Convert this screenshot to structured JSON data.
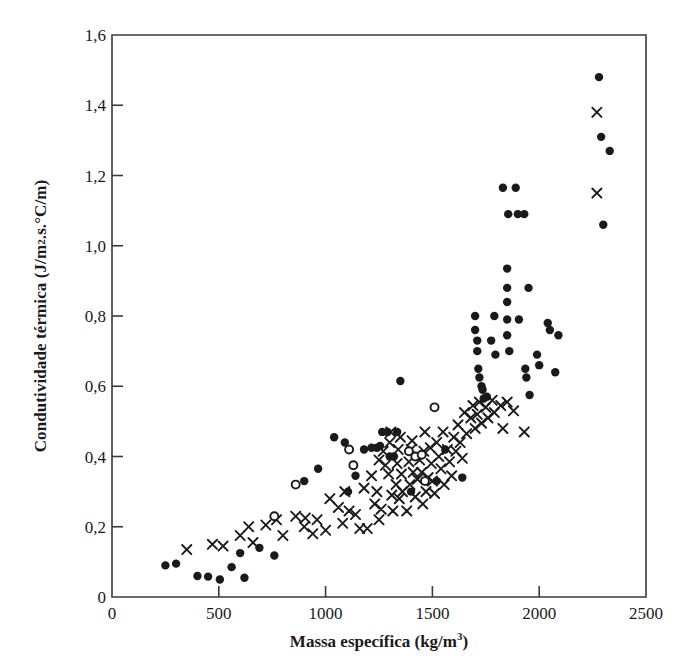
{
  "chart_data": {
    "type": "scatter",
    "title": "",
    "xlabel": "Massa específica (kg/m³)",
    "xlabel_main": "Massa específica (kg/m",
    "xlabel_sup": "3",
    "xlabel_tail": ")",
    "ylabel": "Condutividade térmica (J/m².s.°C/m)",
    "ylabel_main": "Condutividade térmica (J/m",
    "ylabel_sup": "2",
    "ylabel_tail": ".s.°C/m)",
    "xlim": [
      0,
      2500
    ],
    "ylim": [
      0,
      1.6
    ],
    "xticks": [
      0,
      500,
      1000,
      1500,
      2000,
      2500
    ],
    "xtick_labels": [
      "0",
      "500",
      "1000",
      "1500",
      "2000",
      "2500"
    ],
    "yticks": [
      0,
      0.2,
      0.4,
      0.6,
      0.8,
      1.0,
      1.2,
      1.4,
      1.6
    ],
    "ytick_labels": [
      "0",
      "0,2",
      "0,4",
      "0,6",
      "0,8",
      "1,0",
      "1,2",
      "1,4",
      "1,6"
    ],
    "grid": false,
    "legend": "none",
    "marker_color": "#1a1a1a",
    "frame_color": "#3a3a3a",
    "series": [
      {
        "name": "filled-circle",
        "marker": "filled-circle",
        "points": [
          [
            250,
            0.09
          ],
          [
            300,
            0.095
          ],
          [
            400,
            0.06
          ],
          [
            450,
            0.058
          ],
          [
            505,
            0.05
          ],
          [
            560,
            0.085
          ],
          [
            600,
            0.125
          ],
          [
            620,
            0.055
          ],
          [
            690,
            0.14
          ],
          [
            760,
            0.118
          ],
          [
            900,
            0.33
          ],
          [
            965,
            0.365
          ],
          [
            1040,
            0.455
          ],
          [
            1090,
            0.44
          ],
          [
            1105,
            0.3
          ],
          [
            1140,
            0.345
          ],
          [
            1180,
            0.42
          ],
          [
            1215,
            0.425
          ],
          [
            1240,
            0.425
          ],
          [
            1255,
            0.43
          ],
          [
            1265,
            0.47
          ],
          [
            1290,
            0.47
          ],
          [
            1300,
            0.4
          ],
          [
            1320,
            0.4
          ],
          [
            1335,
            0.47
          ],
          [
            1350,
            0.615
          ],
          [
            1400,
            0.3
          ],
          [
            1520,
            0.33
          ],
          [
            1560,
            0.42
          ],
          [
            1640,
            0.34
          ],
          [
            1700,
            0.76
          ],
          [
            1700,
            0.8
          ],
          [
            1710,
            0.7
          ],
          [
            1710,
            0.73
          ],
          [
            1715,
            0.65
          ],
          [
            1720,
            0.625
          ],
          [
            1730,
            0.6
          ],
          [
            1735,
            0.59
          ],
          [
            1740,
            0.565
          ],
          [
            1755,
            0.57
          ],
          [
            1775,
            0.73
          ],
          [
            1790,
            0.8
          ],
          [
            1795,
            0.69
          ],
          [
            1830,
            1.165
          ],
          [
            1850,
            0.935
          ],
          [
            1850,
            0.88
          ],
          [
            1850,
            0.84
          ],
          [
            1850,
            0.79
          ],
          [
            1850,
            0.745
          ],
          [
            1855,
            1.09
          ],
          [
            1860,
            0.7
          ],
          [
            1890,
            1.165
          ],
          [
            1900,
            1.09
          ],
          [
            1905,
            0.79
          ],
          [
            1930,
            1.09
          ],
          [
            1935,
            0.65
          ],
          [
            1940,
            0.625
          ],
          [
            1950,
            0.88
          ],
          [
            1955,
            0.575
          ],
          [
            1990,
            0.69
          ],
          [
            2000,
            0.66
          ],
          [
            2040,
            0.78
          ],
          [
            2050,
            0.76
          ],
          [
            2075,
            0.64
          ],
          [
            2090,
            0.745
          ],
          [
            2280,
            1.48
          ],
          [
            2290,
            1.31
          ],
          [
            2330,
            1.27
          ],
          [
            2300,
            1.06
          ]
        ]
      },
      {
        "name": "x-cross",
        "marker": "x-cross",
        "points": [
          [
            350,
            0.135
          ],
          [
            470,
            0.15
          ],
          [
            520,
            0.145
          ],
          [
            600,
            0.175
          ],
          [
            640,
            0.2
          ],
          [
            660,
            0.155
          ],
          [
            720,
            0.205
          ],
          [
            770,
            0.22
          ],
          [
            800,
            0.175
          ],
          [
            860,
            0.23
          ],
          [
            900,
            0.2
          ],
          [
            905,
            0.225
          ],
          [
            940,
            0.18
          ],
          [
            960,
            0.22
          ],
          [
            1000,
            0.19
          ],
          [
            1020,
            0.28
          ],
          [
            1060,
            0.255
          ],
          [
            1080,
            0.21
          ],
          [
            1090,
            0.3
          ],
          [
            1110,
            0.245
          ],
          [
            1140,
            0.235
          ],
          [
            1160,
            0.195
          ],
          [
            1180,
            0.31
          ],
          [
            1195,
            0.195
          ],
          [
            1215,
            0.345
          ],
          [
            1230,
            0.265
          ],
          [
            1240,
            0.3
          ],
          [
            1250,
            0.39
          ],
          [
            1250,
            0.22
          ],
          [
            1260,
            0.25
          ],
          [
            1270,
            0.415
          ],
          [
            1280,
            0.375
          ],
          [
            1295,
            0.35
          ],
          [
            1300,
            0.44
          ],
          [
            1305,
            0.47
          ],
          [
            1310,
            0.29
          ],
          [
            1315,
            0.245
          ],
          [
            1330,
            0.32
          ],
          [
            1335,
            0.38
          ],
          [
            1340,
            0.42
          ],
          [
            1345,
            0.28
          ],
          [
            1350,
            0.455
          ],
          [
            1355,
            0.35
          ],
          [
            1360,
            0.3
          ],
          [
            1380,
            0.245
          ],
          [
            1390,
            0.385
          ],
          [
            1395,
            0.32
          ],
          [
            1400,
            0.42
          ],
          [
            1405,
            0.445
          ],
          [
            1410,
            0.355
          ],
          [
            1420,
            0.285
          ],
          [
            1430,
            0.335
          ],
          [
            1440,
            0.39
          ],
          [
            1450,
            0.355
          ],
          [
            1455,
            0.265
          ],
          [
            1460,
            0.415
          ],
          [
            1465,
            0.47
          ],
          [
            1470,
            0.3
          ],
          [
            1480,
            0.34
          ],
          [
            1490,
            0.425
          ],
          [
            1495,
            0.38
          ],
          [
            1500,
            0.33
          ],
          [
            1510,
            0.295
          ],
          [
            1520,
            0.44
          ],
          [
            1530,
            0.4
          ],
          [
            1540,
            0.365
          ],
          [
            1550,
            0.47
          ],
          [
            1555,
            0.32
          ],
          [
            1570,
            0.42
          ],
          [
            1580,
            0.385
          ],
          [
            1590,
            0.345
          ],
          [
            1600,
            0.455
          ],
          [
            1610,
            0.415
          ],
          [
            1620,
            0.49
          ],
          [
            1630,
            0.44
          ],
          [
            1640,
            0.395
          ],
          [
            1650,
            0.525
          ],
          [
            1660,
            0.465
          ],
          [
            1680,
            0.51
          ],
          [
            1690,
            0.545
          ],
          [
            1700,
            0.48
          ],
          [
            1710,
            0.52
          ],
          [
            1720,
            0.555
          ],
          [
            1730,
            0.495
          ],
          [
            1750,
            0.54
          ],
          [
            1760,
            0.51
          ],
          [
            1780,
            0.56
          ],
          [
            1790,
            0.525
          ],
          [
            1820,
            0.545
          ],
          [
            1830,
            0.48
          ],
          [
            1850,
            0.555
          ],
          [
            1880,
            0.53
          ],
          [
            1930,
            0.47
          ],
          [
            2270,
            1.38
          ],
          [
            2270,
            1.15
          ]
        ]
      },
      {
        "name": "open-circle",
        "marker": "open-circle",
        "points": [
          [
            760,
            0.23
          ],
          [
            860,
            0.32
          ],
          [
            1110,
            0.42
          ],
          [
            1130,
            0.375
          ],
          [
            1390,
            0.415
          ],
          [
            1420,
            0.4
          ],
          [
            1450,
            0.405
          ],
          [
            1465,
            0.33
          ],
          [
            1510,
            0.54
          ]
        ]
      }
    ]
  }
}
